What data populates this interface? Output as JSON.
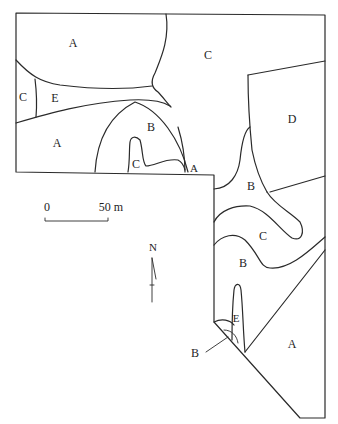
{
  "map": {
    "units": [
      {
        "id": "a-northwest",
        "label": "A"
      },
      {
        "id": "c-north",
        "label": "C"
      },
      {
        "id": "c-west",
        "label": "C"
      },
      {
        "id": "e-west",
        "label": "E"
      },
      {
        "id": "a-west",
        "label": "A"
      },
      {
        "id": "b-center",
        "label": "B"
      },
      {
        "id": "c-lobe",
        "label": "C"
      },
      {
        "id": "a-small",
        "label": "A"
      },
      {
        "id": "d-east",
        "label": "D"
      },
      {
        "id": "b-east",
        "label": "B"
      },
      {
        "id": "c-east",
        "label": "C"
      },
      {
        "id": "b-southeast",
        "label": "B"
      },
      {
        "id": "e-south",
        "label": "E"
      },
      {
        "id": "b-callout",
        "label": "B"
      },
      {
        "id": "a-south",
        "label": "A"
      }
    ]
  },
  "scale_bar": {
    "start_label": "0",
    "end_label": "50 m"
  },
  "north_arrow": {
    "label": "N"
  }
}
